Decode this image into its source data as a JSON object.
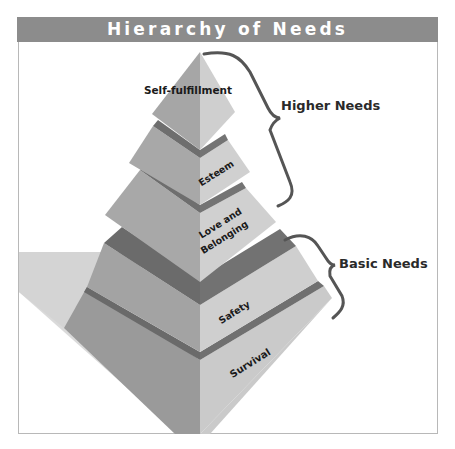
{
  "title": "Hierarchy of Needs",
  "tiers": [
    {
      "level": 5,
      "label": "Self-fulfillment"
    },
    {
      "level": 4,
      "label": "Esteem"
    },
    {
      "level": 3,
      "label_line1": "Love and",
      "label_line2": "Belonging"
    },
    {
      "level": 2,
      "label": "Safety"
    },
    {
      "level": 1,
      "label": "Survival"
    }
  ],
  "groups": [
    {
      "label": "Higher Needs",
      "covers": [
        "Self-fulfillment",
        "Esteem",
        "Love and Belonging"
      ]
    },
    {
      "label": "Basic Needs",
      "covers": [
        "Safety",
        "Survival"
      ]
    }
  ],
  "colors": {
    "header_bg": "#8c8c8c",
    "left_face": "#a6a6a6",
    "right_face": "#cdcdcd",
    "band": "#6e6e6e",
    "shadow": "#d9d9d9",
    "brace": "#555555"
  }
}
